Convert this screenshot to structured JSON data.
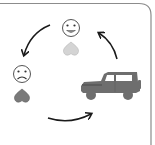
{
  "diagram": {
    "type": "cycle",
    "description": "Emotional cycle involving a vehicle",
    "nodes": [
      {
        "id": "happy",
        "icon": "happy-face-icon",
        "sub_icon": "heart-icon",
        "heart_color": "#d4d4d4"
      },
      {
        "id": "sad",
        "icon": "sad-face-icon",
        "sub_icon": "heart-icon",
        "heart_color": "#7a7a7a"
      },
      {
        "id": "jeep",
        "icon": "jeep-icon",
        "color": "#6e6e6e"
      }
    ],
    "edges": [
      {
        "from": "happy",
        "to": "sad"
      },
      {
        "from": "sad",
        "to": "jeep"
      },
      {
        "from": "jeep",
        "to": "happy"
      }
    ]
  },
  "colors": {
    "border": "#8c8c8c",
    "arrow": "#1a1a1a",
    "face_stroke": "#555555",
    "face_fill": "#ffffff",
    "heart_light": "#d4d4d4",
    "heart_dark": "#7a7a7a",
    "jeep": "#6e6e6e"
  }
}
